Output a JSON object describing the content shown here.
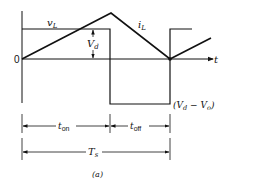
{
  "figure": {
    "caption": "(a)",
    "origin_label": "0",
    "time_axis_label": "t",
    "vL_label": "v",
    "vL_sub": "L",
    "iL_label": "i",
    "iL_sub": "L",
    "vd_label": "V",
    "vd_sub": "d",
    "low_level_label": "(V",
    "low_level_sub1": "d",
    "low_level_mid": " − V",
    "low_level_sub2": "o",
    "low_level_close": ")",
    "ton_label": "t",
    "ton_sub": "on",
    "toff_label": "t",
    "toff_sub": "off",
    "ts_label": "T",
    "ts_sub": "s"
  },
  "colors": {
    "line": "#111111",
    "background": "#ffffff"
  }
}
